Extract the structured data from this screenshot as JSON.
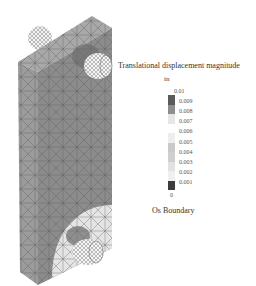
{
  "legend": {
    "title": "Translational displacement magnitude",
    "unit": "in",
    "max_label": "0.01",
    "ticks": [
      "0.009",
      "0.008",
      "0.007",
      "0.006",
      "0.005",
      "0.004",
      "0.003",
      "0.002",
      "0.001"
    ],
    "min_label": "0",
    "colors": [
      "#5a5a5a",
      "#8e8e8e",
      "#e6e6e6",
      "#ffffff",
      "#eeeeee",
      "#c9c9c9",
      "#cfcfcf",
      "#e2e2e2",
      "#3c3c3c"
    ],
    "boundary_label": "Os Boundary"
  },
  "model": {
    "description": "FEA mesh of plate with two pins",
    "plate_color": "#8c8c8c",
    "side_color": "#9c9c9c",
    "top_color": "#a8a8a8",
    "low_zone_color": "#e4e4e4"
  }
}
